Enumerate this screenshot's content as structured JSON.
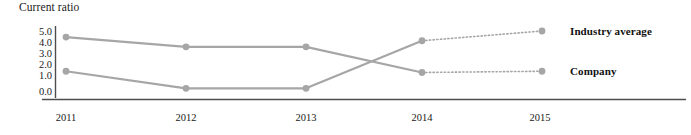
{
  "chart_data": {
    "type": "line",
    "title": "Current ratio",
    "xlabel": "",
    "ylabel": "",
    "categories": [
      "2011",
      "2012",
      "2013",
      "2014",
      "2015"
    ],
    "yticks": [
      "0.0",
      "1.0",
      "2.0",
      "3.0",
      "4.0",
      "5.0"
    ],
    "ylim": [
      0.0,
      5.0
    ],
    "grid": false,
    "legend_position": "right-inline-labels",
    "series": [
      {
        "name": "Industry average",
        "values": [
          1.7,
          0.3,
          0.3,
          4.2,
          5.0
        ],
        "color": "#a6a6a6",
        "marker": "circle",
        "dashed_from_index": 3
      },
      {
        "name": "Company",
        "values": [
          4.5,
          3.7,
          3.7,
          1.6,
          1.7
        ],
        "color": "#a6a6a6",
        "marker": "circle",
        "dashed_from_index": 3
      }
    ]
  },
  "labels": {
    "industry_average": "Industry average",
    "company": "Company"
  },
  "colors": {
    "line": "#a6a6a6",
    "axis": "#4d4d4d",
    "text": "#1a1a1a"
  }
}
